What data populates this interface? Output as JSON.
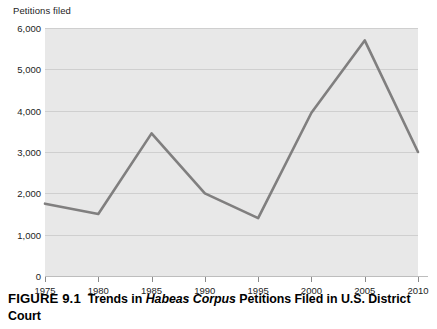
{
  "figure": {
    "caption_number": "FIGURE 9.1",
    "caption_lead": "Trends in ",
    "caption_italic": "Habeas Corpus",
    "caption_tail": " Petitions Filed in U.S. District Court"
  },
  "chart_data": {
    "type": "line",
    "title": "",
    "xlabel": "",
    "ylabel": "Petitions filed",
    "x": [
      1975,
      1980,
      1985,
      1990,
      1995,
      2000,
      2005,
      2010
    ],
    "values": [
      1750,
      1500,
      3450,
      2000,
      1400,
      3950,
      5700,
      3000
    ],
    "categories": [
      "1975",
      "1980",
      "1985",
      "1990",
      "1995",
      "2000",
      "2005",
      "2010"
    ],
    "xlim": [
      1975,
      2010
    ],
    "ylim": [
      0,
      6000
    ],
    "ytick_labels": [
      "6,000",
      "5,000",
      "4,000",
      "3,000",
      "2,000",
      "1,000",
      "0"
    ],
    "ytick_values": [
      6000,
      5000,
      4000,
      3000,
      2000,
      1000,
      0
    ],
    "xtick_labels": [
      "1975",
      "1980",
      "1985",
      "1990",
      "1995",
      "2000",
      "2005",
      "2010"
    ],
    "xtick_values": [
      1975,
      1980,
      1985,
      1990,
      1995,
      2000,
      2005,
      2010
    ],
    "grid": true,
    "legend": "none",
    "series_color": "#807f7f",
    "plot_background": "#e8e8e8",
    "gridline_color": "#cfcfcf"
  }
}
